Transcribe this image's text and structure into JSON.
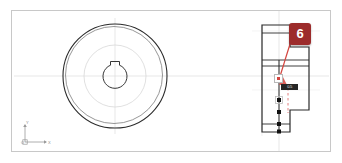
{
  "app": {
    "background_color": "#ffffff",
    "sheet_border_color": "#c8c8c8"
  },
  "callout": {
    "number": "6",
    "badge_color": "#9c2b2b",
    "badge_text_color": "#ffffff",
    "leader_color": "#d4453f",
    "leader_style": "solid-diagonal",
    "dashed_guide_color": "#e07070"
  },
  "dimension_chip": {
    "value": "0.5",
    "background": "#262626",
    "text_color": "#e8e8e8"
  },
  "ucs": {
    "y_label": "Y",
    "x_label": "X",
    "origin_label": "O",
    "color": "#8a8a8a"
  },
  "views": {
    "front_view": {
      "name": "front-circular-view",
      "description": "Concentric circles with central bore and keyway",
      "center_x": 115,
      "center_y": 76,
      "outer_radius": 52,
      "inner_ring_radius": 48,
      "mid_circle_radius": 31,
      "bore_radius": 12,
      "keyway": true,
      "line_color": "#2b2b2b",
      "construction_color": "#d8d8d8"
    },
    "section_view": {
      "name": "right-section-profile",
      "description": "Stepped hub profile with grip handles",
      "line_color": "#2b2b2b",
      "grip_color": "#111111",
      "grip_count": 3
    }
  },
  "geometry": {
    "centerline_color": "#d0d0d0",
    "vertical_divider_x": 279
  }
}
